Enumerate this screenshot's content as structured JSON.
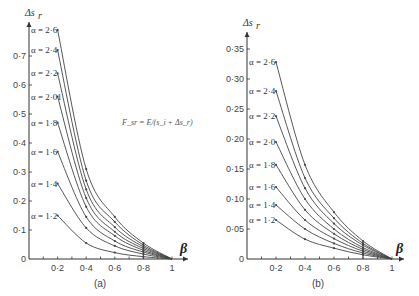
{
  "chart_data": [
    {
      "type": "line",
      "panel_label": "(a)",
      "title": "",
      "xlabel": "β",
      "ylabel": "Δs_r",
      "annotation": "F_sr = E/(s_i + Δs_r)",
      "xlim": [
        0,
        1.05
      ],
      "ylim": [
        0,
        0.8
      ],
      "x_ticks": [
        0.2,
        0.4,
        0.6,
        0.8,
        1
      ],
      "x_tick_labels": [
        "0·2",
        "0·4",
        "0·6",
        "0·8",
        "1"
      ],
      "y_ticks": [
        0,
        0.1,
        0.2,
        0.3,
        0.4,
        0.5,
        0.6,
        0.7
      ],
      "y_tick_labels": [
        "0",
        "0·1",
        "0·2",
        "0·3",
        "0·4",
        "0·5",
        "0·6",
        "0·7"
      ],
      "grid": false,
      "x": [
        0.2,
        0.4,
        0.6,
        0.8,
        1.0
      ],
      "series": [
        {
          "name": "α = 2·6",
          "values": [
            0.79,
            0.31,
            0.145,
            0.055,
            0
          ]
        },
        {
          "name": "α = 2·4",
          "values": [
            0.72,
            0.27,
            0.128,
            0.048,
            0
          ]
        },
        {
          "name": "α = 2·2",
          "values": [
            0.64,
            0.24,
            0.11,
            0.042,
            0
          ]
        },
        {
          "name": "α = 2·01",
          "values": [
            0.56,
            0.21,
            0.094,
            0.036,
            0
          ]
        },
        {
          "name": "α = 1·8",
          "values": [
            0.47,
            0.18,
            0.08,
            0.03,
            0
          ]
        },
        {
          "name": "α = 1·6",
          "values": [
            0.37,
            0.145,
            0.062,
            0.024,
            0
          ]
        },
        {
          "name": "α = 1·4",
          "values": [
            0.26,
            0.107,
            0.045,
            0.017,
            0
          ]
        },
        {
          "name": "α = 1·2",
          "values": [
            0.15,
            0.055,
            0.022,
            0.008,
            0
          ]
        }
      ]
    },
    {
      "type": "line",
      "panel_label": "(b)",
      "title": "",
      "xlabel": "β",
      "ylabel": "Δs_r",
      "xlim": [
        0,
        1.05
      ],
      "ylim": [
        0,
        0.38
      ],
      "x_ticks": [
        0.2,
        0.4,
        0.6,
        0.8,
        1
      ],
      "x_tick_labels": [
        "0·2",
        "0·4",
        "0·6",
        "0·8",
        "1"
      ],
      "y_ticks": [
        0,
        0.05,
        0.1,
        0.15,
        0.2,
        0.25,
        0.3,
        0.35
      ],
      "y_tick_labels": [
        "0",
        "0·05",
        "0·10",
        "0·15",
        "0·20",
        "0·25",
        "0·30",
        "0·35"
      ],
      "grid": false,
      "x": [
        0.2,
        0.4,
        0.6,
        0.8,
        1.0
      ],
      "series": [
        {
          "name": "α = 2·6",
          "values": [
            0.328,
            0.157,
            0.078,
            0.03,
            0
          ]
        },
        {
          "name": "α = 2·4",
          "values": [
            0.28,
            0.135,
            0.068,
            0.026,
            0
          ]
        },
        {
          "name": "α = 2·2",
          "values": [
            0.238,
            0.118,
            0.059,
            0.023,
            0
          ]
        },
        {
          "name": "α = 2·0",
          "values": [
            0.195,
            0.1,
            0.05,
            0.019,
            0
          ]
        },
        {
          "name": "α = 1·8",
          "values": [
            0.157,
            0.082,
            0.042,
            0.016,
            0
          ]
        },
        {
          "name": "α = 1·6",
          "values": [
            0.12,
            0.065,
            0.034,
            0.013,
            0
          ]
        },
        {
          "name": "α = 1·4",
          "values": [
            0.09,
            0.05,
            0.026,
            0.01,
            0
          ]
        },
        {
          "name": "α = 1·2",
          "values": [
            0.065,
            0.033,
            0.018,
            0.007,
            0
          ]
        }
      ]
    }
  ],
  "labels": {
    "panel_a": "(a)",
    "panel_b": "(b)",
    "y_axis_title": "Δs",
    "y_axis_sub": "r",
    "x_axis_title": "β",
    "formula": "F_sr = E/(s_i + Δs_r)"
  },
  "colors": {
    "line": "#444444",
    "axis": "#333333",
    "background": "#ffffff"
  }
}
